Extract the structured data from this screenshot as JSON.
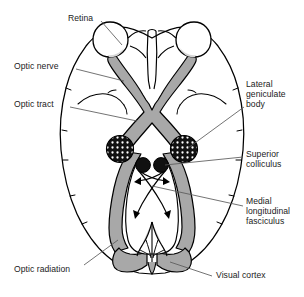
{
  "figure": {
    "view": "inferior (ventral) view",
    "background_color": "#ffffff",
    "line_color": "#000000",
    "pathway_fill": "#a8a8a8",
    "retina_fill": "#ffffff",
    "lgb_fill": "#111111",
    "lgb_dot_color": "#ffffff",
    "colliculus_fill": "#111111",
    "leader_color": "#555555"
  },
  "labels": [
    {
      "id": "retina",
      "text": "Retina",
      "side": "top",
      "x": 68,
      "y": 13,
      "leader_from": [
        101,
        21
      ],
      "leader_to": [
        120,
        44
      ]
    },
    {
      "id": "optic-nerve",
      "text": "Optic nerve",
      "side": "left",
      "x": 14,
      "y": 61,
      "leader_from": [
        76,
        69
      ],
      "leader_to": [
        122,
        80
      ]
    },
    {
      "id": "optic-tract",
      "text": "Optic tract",
      "side": "left",
      "x": 14,
      "y": 99,
      "leader_from": [
        70,
        107
      ],
      "leader_to": [
        135,
        120
      ]
    },
    {
      "id": "lateral-geniculate-body",
      "text": "Lateral\ngeniculate\nbody",
      "side": "right",
      "x": 246,
      "y": 79,
      "leader_from": [
        244,
        107
      ],
      "leader_to": [
        186,
        148
      ]
    },
    {
      "id": "superior-colliculus",
      "text": "Superior\ncolliculus",
      "side": "right",
      "x": 246,
      "y": 149,
      "leader_from": [
        243,
        157
      ],
      "leader_to": [
        162,
        163
      ]
    },
    {
      "id": "medial-longitudinal-fasciculus",
      "text": "Medial\nlongitudinal\nfasciculus",
      "side": "right",
      "x": 246,
      "y": 196,
      "leader_from": [
        243,
        206
      ],
      "leader_to": [
        152,
        186
      ]
    },
    {
      "id": "optic-radiation",
      "text": "Optic radiation",
      "side": "left",
      "x": 14,
      "y": 264,
      "leader_from": [
        84,
        265
      ],
      "leader_to": [
        118,
        241
      ]
    },
    {
      "id": "visual-cortex",
      "text": "Visual cortex",
      "side": "right",
      "x": 216,
      "y": 270,
      "leader_from": [
        212,
        276
      ],
      "leader_to": [
        169,
        262
      ]
    }
  ],
  "structures": [
    {
      "id": "brain-outline",
      "name": "cerebral hemispheres outline"
    },
    {
      "id": "retina-left",
      "name": "left retina / eyeball"
    },
    {
      "id": "retina-right",
      "name": "right retina / eyeball"
    },
    {
      "id": "optic-nerve-left",
      "name": "left optic nerve"
    },
    {
      "id": "optic-nerve-right",
      "name": "right optic nerve"
    },
    {
      "id": "optic-chiasm",
      "name": "optic chiasm"
    },
    {
      "id": "optic-tract-left",
      "name": "left optic tract"
    },
    {
      "id": "optic-tract-right",
      "name": "right optic tract"
    },
    {
      "id": "lgb-left",
      "name": "left lateral geniculate body"
    },
    {
      "id": "lgb-right",
      "name": "right lateral geniculate body"
    },
    {
      "id": "colliculus-left",
      "name": "left superior colliculus"
    },
    {
      "id": "colliculus-right",
      "name": "right superior colliculus"
    },
    {
      "id": "mlf-arrows",
      "name": "medial longitudinal fasciculus arrows"
    },
    {
      "id": "optic-radiation-left",
      "name": "left optic radiation"
    },
    {
      "id": "optic-radiation-right",
      "name": "right optic radiation"
    },
    {
      "id": "visual-cortex-left",
      "name": "left visual cortex / occipital lobe"
    },
    {
      "id": "visual-cortex-right",
      "name": "right visual cortex / occipital lobe"
    },
    {
      "id": "brainstem",
      "name": "brainstem / cerebellum"
    }
  ]
}
